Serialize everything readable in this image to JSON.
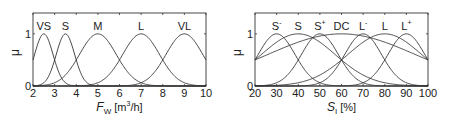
{
  "chart_data": [
    {
      "type": "line",
      "title": "",
      "xlabel": "F_W [m^3/h]",
      "xlabel_parts": {
        "main": "F",
        "sub": "W",
        "unit_pre": " [m",
        "sup": "3",
        "unit_post": "/h]"
      },
      "ylabel": "μ",
      "xlim": [
        2,
        10
      ],
      "ylim": [
        0,
        1.4
      ],
      "xticks": [
        "2",
        "3",
        "4",
        "5",
        "6",
        "7",
        "8",
        "9",
        "10"
      ],
      "yticks": [
        "0",
        "1"
      ],
      "grid": false,
      "legend": "inline labels above peaks",
      "series": [
        {
          "name": "VS",
          "center": 2.5,
          "halfwidth": 0.5
        },
        {
          "name": "S",
          "center": 3.5,
          "halfwidth": 0.5
        },
        {
          "name": "M",
          "center": 5,
          "halfwidth": 1
        },
        {
          "name": "L",
          "center": 7,
          "halfwidth": 1
        },
        {
          "name": "VL",
          "center": 9,
          "halfwidth": 1
        }
      ]
    },
    {
      "type": "line",
      "title": "",
      "xlabel": "S_I [%]",
      "xlabel_parts": {
        "main": "S",
        "sub": "I",
        "unit": " [%]"
      },
      "ylabel": "μ",
      "xlim": [
        20,
        100
      ],
      "ylim": [
        0,
        1.4
      ],
      "xticks": [
        "20",
        "30",
        "40",
        "50",
        "60",
        "70",
        "80",
        "90",
        "100"
      ],
      "yticks": [
        "0",
        "1"
      ],
      "grid": false,
      "legend": "inline labels above peaks",
      "series": [
        {
          "name": "S⁻",
          "label": "S",
          "sup": "-",
          "center": 30,
          "halfwidth": 10
        },
        {
          "name": "S",
          "label": "S",
          "sup": "",
          "center": 40,
          "halfwidth": 20
        },
        {
          "name": "S⁺",
          "label": "S",
          "sup": "+",
          "center": 50,
          "halfwidth": 10
        },
        {
          "name": "DC",
          "label": "DC",
          "sup": "",
          "center": 60,
          "halfwidth": 40
        },
        {
          "name": "L⁻",
          "label": "L",
          "sup": "-",
          "center": 70,
          "halfwidth": 10
        },
        {
          "name": "L",
          "label": "L",
          "sup": "",
          "center": 80,
          "halfwidth": 20
        },
        {
          "name": "L⁺",
          "label": "L",
          "sup": "+",
          "center": 90,
          "halfwidth": 10
        }
      ]
    }
  ]
}
